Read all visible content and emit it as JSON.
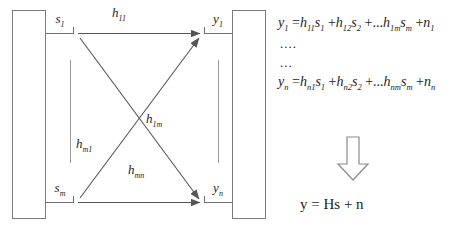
{
  "figure": {
    "stroke_color": "#6f6f6f",
    "text_color": "#1d1d1d"
  },
  "transmit_side": {
    "array_name": "transmit-antenna-array",
    "ports": [
      {
        "id": "s1",
        "label": "s",
        "sub": "1"
      },
      {
        "id": "sm",
        "label": "s",
        "sub": "m"
      }
    ],
    "ellipsis": "vertical-dots"
  },
  "receive_side": {
    "array_name": "receive-antenna-array",
    "ports": [
      {
        "id": "y1",
        "label": "y",
        "sub": "1"
      },
      {
        "id": "yn",
        "label": "y",
        "sub": "n"
      }
    ],
    "ellipsis": "vertical-dots"
  },
  "channel_paths": [
    {
      "id": "h11",
      "label": "h",
      "sub": "11",
      "from": "s1",
      "to": "y1"
    },
    {
      "id": "h1m",
      "label": "h",
      "sub": "1m",
      "from": "s1",
      "to": "yn"
    },
    {
      "id": "hm1",
      "label": "h",
      "sub": "m1",
      "from": "sm",
      "to": "y1"
    },
    {
      "id": "hmn",
      "label": "h",
      "sub": "mn",
      "from": "sm",
      "to": "yn"
    }
  ],
  "equations": {
    "line1": {
      "lhs": "y",
      "lhs_sub": "1",
      "terms": [
        {
          "coef": "h",
          "coef_sub": "11",
          "var": "s",
          "var_sub": "1"
        },
        {
          "coef": "h",
          "coef_sub": "12",
          "var": "s",
          "var_sub": "2"
        },
        {
          "coef": "h",
          "coef_sub": "1m",
          "var": "s",
          "var_sub": "m"
        }
      ],
      "noise": "n",
      "noise_sub": "1",
      "ellipsis_before_last": "..."
    },
    "dots1": "....",
    "dots2": "...",
    "line2": {
      "lhs": "y",
      "lhs_sub": "n",
      "terms": [
        {
          "coef": "h",
          "coef_sub": "n1",
          "var": "s",
          "var_sub": "1"
        },
        {
          "coef": "h",
          "coef_sub": "n2",
          "var": "s",
          "var_sub": "2"
        },
        {
          "coef": "h",
          "coef_sub": "nm",
          "var": "s",
          "var_sub": "m"
        }
      ],
      "noise": "n",
      "noise_sub": "n",
      "ellipsis_before_last": "..."
    },
    "final": "y = Hs + n",
    "arrow": "down-arrow"
  }
}
